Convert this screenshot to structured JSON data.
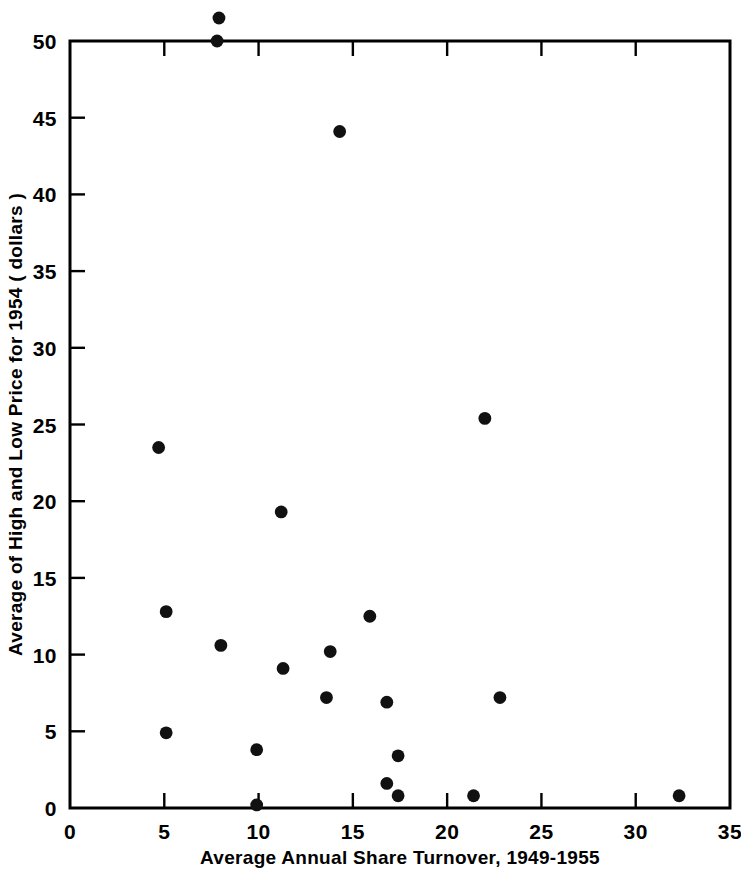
{
  "chart_data": {
    "type": "scatter",
    "title": "",
    "xlabel": "Average Annual Share Turnover, 1949-1955",
    "xlabel_line2": "( in percentage terms )",
    "ylabel": "Average of High and Low Price for 1954 ( dollars )",
    "xlim": [
      0,
      35
    ],
    "ylim": [
      0,
      50
    ],
    "grid": false,
    "legend": null,
    "xticks": [
      0,
      5,
      10,
      15,
      20,
      25,
      30,
      35
    ],
    "xtick_labels": [
      "0",
      "5",
      "10",
      "15",
      "20",
      "25",
      "30",
      "35"
    ],
    "yticks": [
      0,
      5,
      10,
      15,
      20,
      25,
      30,
      35,
      40,
      45,
      50
    ],
    "ytick_labels": [
      "0",
      "5",
      "10",
      "15",
      "20",
      "25",
      "30",
      "35",
      "40",
      "45",
      "50"
    ],
    "series": [
      {
        "name": "stocks",
        "marker": "filled-circle",
        "color": "#111111",
        "points": [
          {
            "x": 7.9,
            "y": 51.5
          },
          {
            "x": 7.8,
            "y": 50.0
          },
          {
            "x": 14.3,
            "y": 44.1
          },
          {
            "x": 22.0,
            "y": 25.4
          },
          {
            "x": 4.7,
            "y": 23.5
          },
          {
            "x": 11.2,
            "y": 19.3
          },
          {
            "x": 15.9,
            "y": 12.5
          },
          {
            "x": 5.1,
            "y": 12.8
          },
          {
            "x": 8.0,
            "y": 10.6
          },
          {
            "x": 13.8,
            "y": 10.2
          },
          {
            "x": 11.3,
            "y": 9.1
          },
          {
            "x": 13.6,
            "y": 7.2
          },
          {
            "x": 22.8,
            "y": 7.2
          },
          {
            "x": 16.8,
            "y": 6.9
          },
          {
            "x": 5.1,
            "y": 4.9
          },
          {
            "x": 9.9,
            "y": 3.8
          },
          {
            "x": 17.4,
            "y": 3.4
          },
          {
            "x": 16.8,
            "y": 1.6
          },
          {
            "x": 17.4,
            "y": 0.8
          },
          {
            "x": 21.4,
            "y": 0.8
          },
          {
            "x": 32.3,
            "y": 0.8
          },
          {
            "x": 9.9,
            "y": 0.2
          }
        ]
      }
    ]
  }
}
